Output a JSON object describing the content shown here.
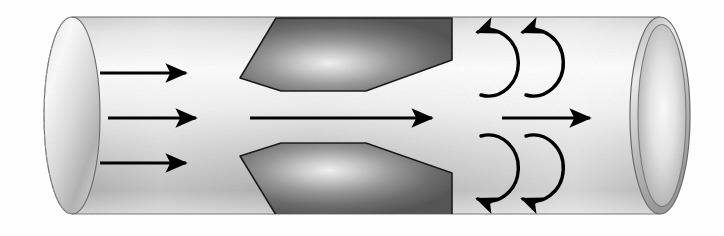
{
  "figure": {
    "background_color": "#fefefe",
    "width": 724,
    "height": 236
  },
  "pipe": {
    "name": "cylindrical-pipe",
    "outline_color": "#6b6b6b",
    "body_fill_light": "#fdfdfd",
    "body_fill_mid": "#d8d8d8",
    "body_fill_dark": "#9a9a9a",
    "top_edge_y": 17,
    "bottom_edge_y": 214,
    "left_cap_center_x": 72,
    "left_cap_rx": 28,
    "right_mouth_center_x": 660,
    "right_mouth_rx": 30,
    "left_cap": {
      "name": "left-end-cap",
      "hidden_edge_style": "dashed",
      "hidden_edge_color": "#9a9a9a",
      "visible_edge_color": "#6b6b6b"
    },
    "right_mouth": {
      "name": "right-open-end",
      "wall_thickness_px": 6,
      "rim_fill_light": "#f2f2f2",
      "rim_fill_dark": "#b0b0b0",
      "bore_fill_light": "#fbfbfb",
      "bore_fill_dark": "#a8a8a8"
    }
  },
  "constriction": {
    "name": "orifice-constriction",
    "fill_light": "#efefef",
    "fill_mid": "#8d8d8d",
    "fill_dark": "#5a5a5a",
    "stroke_color": "#1a1a1a",
    "upper_points": "240,78 276,18 452,18 452,60 366,91 281,91",
    "lower_points": "240,156 276,215 452,215 452,173 366,143 281,143"
  },
  "arrows": {
    "inflow": {
      "name": "inflow-arrows",
      "label": "uniform inflow",
      "count": 3,
      "color": "#000000",
      "items": [
        {
          "name": "inflow-arrow-top",
          "x1": 100,
          "y1": 73,
          "x2": 186,
          "y2": 73
        },
        {
          "name": "inflow-arrow-middle",
          "x1": 108,
          "y1": 118,
          "x2": 196,
          "y2": 118
        },
        {
          "name": "inflow-arrow-bottom",
          "x1": 100,
          "y1": 163,
          "x2": 186,
          "y2": 163
        }
      ]
    },
    "throat": {
      "name": "throat-jet-arrow",
      "label": "accelerated jet through throat",
      "color": "#000000",
      "x1": 250,
      "y1": 118,
      "x2": 432,
      "y2": 118
    },
    "outflow": {
      "name": "outflow-arrow",
      "label": "downstream flow",
      "color": "#000000",
      "x1": 502,
      "y1": 118,
      "x2": 590,
      "y2": 118
    },
    "eddies": {
      "name": "turbulent-eddy-arrows",
      "label": "recirculating eddies",
      "color": "#000000",
      "items": [
        {
          "name": "eddy-arrow-upper-left",
          "cx": 488,
          "cy": 63,
          "r": 30,
          "side": "upper"
        },
        {
          "name": "eddy-arrow-upper-right",
          "cx": 533,
          "cy": 63,
          "r": 30,
          "side": "upper"
        },
        {
          "name": "eddy-arrow-lower-left",
          "cx": 488,
          "cy": 168,
          "r": 30,
          "side": "lower"
        },
        {
          "name": "eddy-arrow-lower-right",
          "cx": 533,
          "cy": 168,
          "r": 30,
          "side": "lower"
        }
      ]
    }
  }
}
